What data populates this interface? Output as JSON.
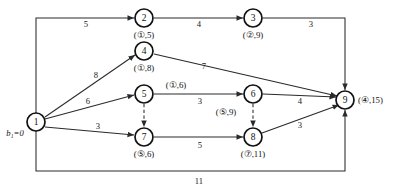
{
  "figure": {
    "type": "network-flow-diagram",
    "source_node": "1",
    "sink_node": "9",
    "source_potential_label": "b₁=0"
  },
  "nodes": [
    {
      "id": "1",
      "text": "1",
      "x": 36,
      "y": 122,
      "label": "",
      "label_x": 0,
      "label_y": 0
    },
    {
      "id": "2",
      "text": "2",
      "x": 144,
      "y": 18,
      "label": "(①,5)",
      "label_x": 144,
      "label_y": 35
    },
    {
      "id": "3",
      "text": "3",
      "x": 253,
      "y": 18,
      "label": "(②,9)",
      "label_x": 253,
      "label_y": 35
    },
    {
      "id": "4",
      "text": "4",
      "x": 144,
      "y": 51,
      "label": "(①,8)",
      "label_x": 144,
      "label_y": 68
    },
    {
      "id": "5",
      "text": "5",
      "x": 144,
      "y": 94,
      "label": "(①,6)",
      "label_x": 176,
      "label_y": 85
    },
    {
      "id": "6",
      "text": "6",
      "x": 253,
      "y": 94,
      "label": "(⑤,9)",
      "label_x": 226,
      "label_y": 112
    },
    {
      "id": "7",
      "text": "7",
      "x": 144,
      "y": 137,
      "label": "(⑤,6)",
      "label_x": 144,
      "label_y": 154
    },
    {
      "id": "8",
      "text": "8",
      "x": 253,
      "y": 137,
      "label": "(⑦,11)",
      "label_x": 253,
      "label_y": 154
    },
    {
      "id": "9",
      "text": "9",
      "x": 345,
      "y": 100,
      "label": "(④,15)",
      "label_x": 378,
      "label_y": 100
    }
  ],
  "edges": [
    {
      "from": "1",
      "to": "2",
      "weight": "5",
      "style": "solid",
      "weight_x": 86,
      "weight_y": 24
    },
    {
      "from": "2",
      "to": "3",
      "weight": "4",
      "style": "solid",
      "weight_x": 199,
      "weight_y": 24
    },
    {
      "from": "3",
      "to": "9",
      "weight": "3",
      "style": "solid",
      "weight_x": 311,
      "weight_y": 24
    },
    {
      "from": "1",
      "to": "4",
      "weight": "8",
      "style": "solid",
      "weight_x": 96,
      "weight_y": 75
    },
    {
      "from": "4",
      "to": "9",
      "weight": "7",
      "style": "solid",
      "weight_x": 204,
      "weight_y": 66
    },
    {
      "from": "1",
      "to": "5",
      "weight": "6",
      "style": "solid",
      "weight_x": 88,
      "weight_y": 101
    },
    {
      "from": "5",
      "to": "6",
      "weight": "3",
      "style": "solid",
      "weight_x": 200,
      "weight_y": 101
    },
    {
      "from": "6",
      "to": "9",
      "weight": "4",
      "style": "solid",
      "weight_x": 300,
      "weight_y": 101
    },
    {
      "from": "1",
      "to": "7",
      "weight": "3",
      "style": "solid",
      "weight_x": 98,
      "weight_y": 126
    },
    {
      "from": "7",
      "to": "8",
      "weight": "5",
      "style": "solid",
      "weight_x": 200,
      "weight_y": 145
    },
    {
      "from": "8",
      "to": "9",
      "weight": "3",
      "style": "solid",
      "weight_x": 300,
      "weight_y": 125
    },
    {
      "from": "1",
      "to": "9",
      "weight": "11",
      "style": "solid",
      "weight_x": 199,
      "weight_y": 181
    },
    {
      "from": "5",
      "to": "7",
      "weight": "",
      "style": "dashed",
      "weight_x": 0,
      "weight_y": 0
    },
    {
      "from": "6",
      "to": "8",
      "weight": "",
      "style": "dashed",
      "weight_x": 0,
      "weight_y": 0
    }
  ],
  "frame": {
    "top_y": 11,
    "bottom_y": 171,
    "left_x": 36,
    "right_x": 345
  }
}
